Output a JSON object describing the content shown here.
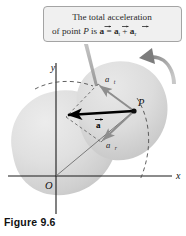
{
  "figure": {
    "caption": "Figure 9.6",
    "callout": {
      "line1": "The total acceleration",
      "line2_pre": "of point ",
      "line2_p": "P",
      "line2_is": " is ",
      "line2_a": "a",
      "line2_eq": " = ",
      "line2_at": "a",
      "line2_at_sub": "t",
      "line2_plus": " + ",
      "line2_ar": "a",
      "line2_ar_sub": "r",
      "full_text": "The total acceleration of point P is a = a_t + a_r"
    },
    "axes": {
      "x_label": "x",
      "y_label": "y",
      "origin_label": "O"
    },
    "labels": {
      "point": "P",
      "total_accel": "a",
      "tangential": "a",
      "tangential_sub": "t",
      "radial": "a",
      "radial_sub": "r"
    },
    "colors": {
      "callout_fill": "#f0f0f0",
      "callout_border": "#9a9a9a",
      "body_fill_light": "#e3e3e3",
      "body_fill_dark": "#c9c9c9",
      "vector_bold": "#000000",
      "vector_gray": "#8e8e8e",
      "axis": "#1a1a1a",
      "dashed": "#5a5a5a",
      "rotation_arrow": "#8a8a8a"
    },
    "icons": {
      "rotation": "rotation-arrow-icon",
      "callout_tail": "callout-tail-icon"
    }
  }
}
